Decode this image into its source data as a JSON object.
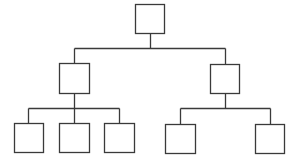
{
  "diagram": {
    "type": "org-chart-tree",
    "colors": {
      "stroke": "#3a3a3a",
      "background": "#ffffff",
      "node_fill": "#ffffff"
    },
    "nodes": [
      {
        "id": "root",
        "label": "",
        "x": 135,
        "y": 4,
        "w": 29,
        "h": 29
      },
      {
        "id": "mid-left",
        "label": "",
        "x": 59,
        "y": 63,
        "w": 30,
        "h": 30
      },
      {
        "id": "mid-right",
        "label": "",
        "x": 210,
        "y": 64,
        "w": 29,
        "h": 29
      },
      {
        "id": "leaf-1",
        "label": "",
        "x": 14,
        "y": 123,
        "w": 29,
        "h": 29
      },
      {
        "id": "leaf-2",
        "label": "",
        "x": 59,
        "y": 123,
        "w": 30,
        "h": 29
      },
      {
        "id": "leaf-3",
        "label": "",
        "x": 104,
        "y": 123,
        "w": 30,
        "h": 29
      },
      {
        "id": "leaf-4",
        "label": "",
        "x": 165,
        "y": 124,
        "w": 30,
        "h": 29
      },
      {
        "id": "leaf-5",
        "label": "",
        "x": 255,
        "y": 124,
        "w": 29,
        "h": 29
      }
    ],
    "edges": [
      {
        "from": "root",
        "to": "mid-left"
      },
      {
        "from": "root",
        "to": "mid-right"
      },
      {
        "from": "mid-left",
        "to": "leaf-1"
      },
      {
        "from": "mid-left",
        "to": "leaf-2"
      },
      {
        "from": "mid-left",
        "to": "leaf-3"
      },
      {
        "from": "mid-right",
        "to": "leaf-4"
      },
      {
        "from": "mid-right",
        "to": "leaf-5"
      }
    ],
    "connectors": [
      {
        "name": "root-stem",
        "x1": 150,
        "y1": 33,
        "x2": 150,
        "y2": 48
      },
      {
        "name": "level1-bus",
        "x1": 74,
        "y1": 48,
        "x2": 225,
        "y2": 48
      },
      {
        "name": "mid-left-drop",
        "x1": 74,
        "y1": 48,
        "x2": 74,
        "y2": 63
      },
      {
        "name": "mid-right-drop",
        "x1": 225,
        "y1": 48,
        "x2": 225,
        "y2": 64
      },
      {
        "name": "mid-left-stem",
        "x1": 74,
        "y1": 93,
        "x2": 74,
        "y2": 108
      },
      {
        "name": "left-bus",
        "x1": 28,
        "y1": 108,
        "x2": 119,
        "y2": 108
      },
      {
        "name": "leaf-1-drop",
        "x1": 28,
        "y1": 108,
        "x2": 28,
        "y2": 123
      },
      {
        "name": "leaf-2-drop",
        "x1": 74,
        "y1": 108,
        "x2": 74,
        "y2": 123
      },
      {
        "name": "leaf-3-drop",
        "x1": 119,
        "y1": 108,
        "x2": 119,
        "y2": 123
      },
      {
        "name": "mid-right-stem",
        "x1": 225,
        "y1": 93,
        "x2": 225,
        "y2": 108
      },
      {
        "name": "right-bus",
        "x1": 180,
        "y1": 108,
        "x2": 270,
        "y2": 108
      },
      {
        "name": "leaf-4-drop",
        "x1": 180,
        "y1": 108,
        "x2": 180,
        "y2": 124
      },
      {
        "name": "leaf-5-drop",
        "x1": 270,
        "y1": 108,
        "x2": 270,
        "y2": 124
      }
    ]
  }
}
